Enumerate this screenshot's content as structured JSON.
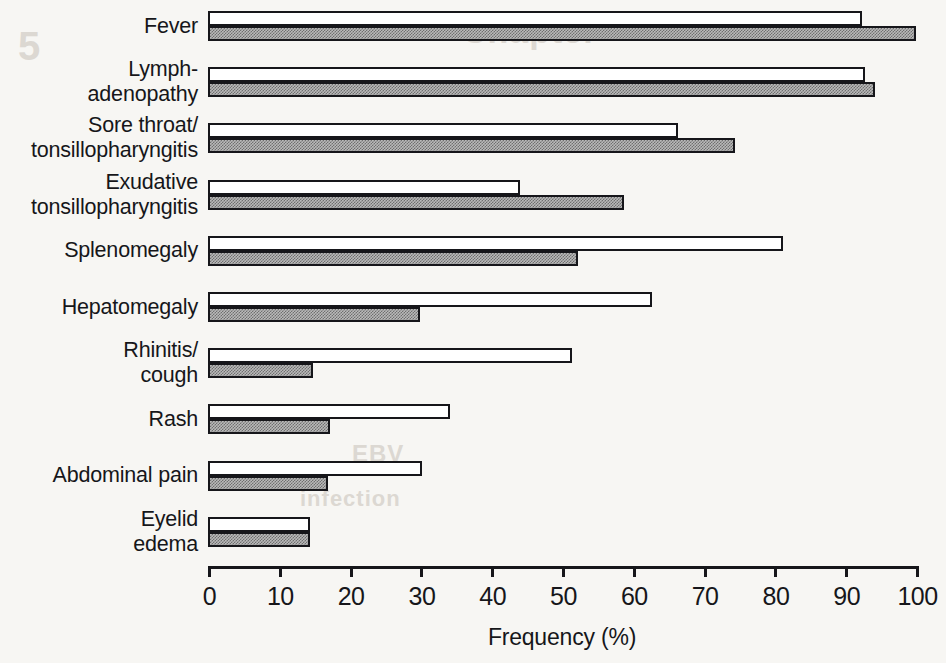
{
  "ghost_text": {
    "a": "5",
    "b": "Chapter",
    "c": "Epstein-Barr Virus",
    "d": "EBV",
    "e": "infection"
  },
  "chart_data": {
    "type": "bar",
    "orientation": "horizontal",
    "title": "",
    "xlabel": "Frequency (%)",
    "ylabel": "",
    "xlim": [
      0,
      100
    ],
    "xticks": [
      0,
      10,
      20,
      30,
      40,
      50,
      60,
      70,
      80,
      90,
      100
    ],
    "xtick_labels": [
      "0",
      "10",
      "20",
      "30",
      "40",
      "50",
      "60",
      "70",
      "80",
      "90",
      "100"
    ],
    "grid": false,
    "legend": null,
    "categories": [
      "Fever",
      "Lymph-\nadenopathy",
      "Sore throat/\ntonsillopharyngitis",
      "Exudative\ntonsillopharyngitis",
      "Splenomegaly",
      "Hepatomegaly",
      "Rhinitis/\ncough",
      "Rash",
      "Abdominal pain",
      "Eyelid\nedema"
    ],
    "series": [
      {
        "name": "open",
        "style": "white-filled",
        "values": [
          92.4,
          92.8,
          66.4,
          44.1,
          81.2,
          62.7,
          51.4,
          34.2,
          30.2,
          14.4
        ]
      },
      {
        "name": "shaded",
        "style": "gray-hatched",
        "values": [
          100.0,
          94.2,
          74.4,
          58.8,
          52.3,
          30.0,
          14.8,
          17.2,
          16.9,
          14.4
        ]
      }
    ]
  },
  "geometry": {
    "axis_x0": 208,
    "axis_x1": 916,
    "axis_y": 566,
    "group_top0": 11,
    "group_step": 56.2,
    "label_left_offset": 0
  }
}
